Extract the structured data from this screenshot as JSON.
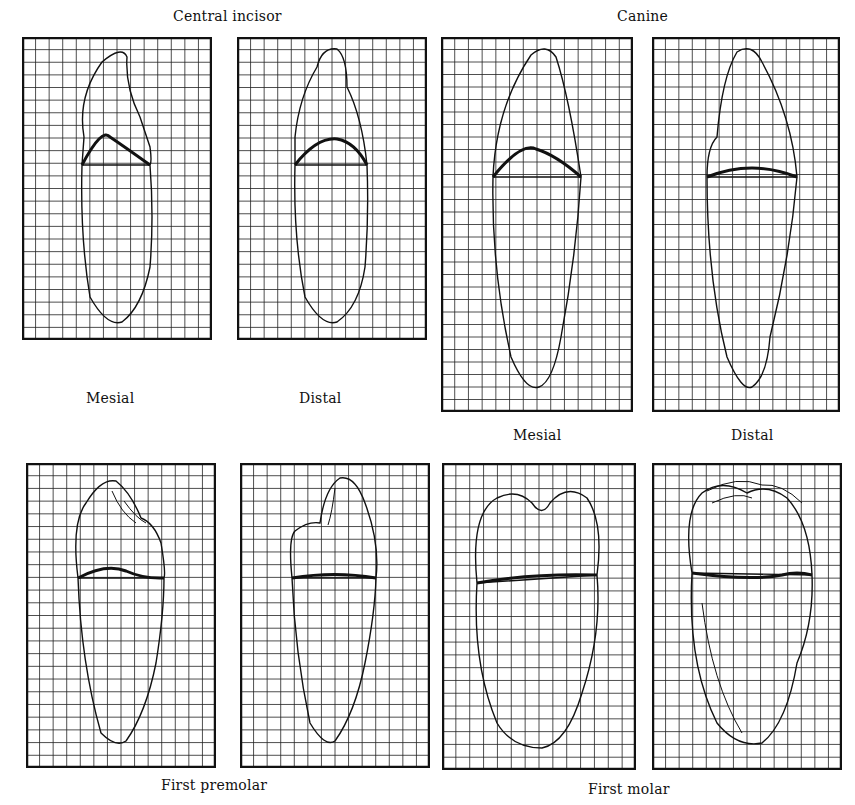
{
  "figure": {
    "groups": [
      {
        "title": "Central incisor",
        "views": [
          "Mesial",
          "Distal"
        ]
      },
      {
        "title": "Canine",
        "views": [
          "Mesial",
          "Distal"
        ]
      },
      {
        "title": "First premolar",
        "views": [],
        "position": "below"
      },
      {
        "title": "First molar",
        "views": [],
        "position": "below"
      }
    ],
    "labels": {
      "central_incisor": "Central incisor",
      "canine": "Canine",
      "first_premolar": "First premolar",
      "first_molar": "First molar",
      "incisor_mesial": "Mesial",
      "incisor_distal": "Distal",
      "canine_mesial": "Mesial",
      "canine_distal": "Distal"
    },
    "panels": [
      {
        "id": "incisor-mesial",
        "x": 22,
        "y": 37,
        "w": 190,
        "h": 303,
        "cols": 14,
        "rows": 24
      },
      {
        "id": "incisor-distal",
        "x": 237,
        "y": 37,
        "w": 190,
        "h": 303,
        "cols": 14,
        "rows": 24
      },
      {
        "id": "canine-mesial",
        "x": 441,
        "y": 37,
        "w": 192,
        "h": 375,
        "cols": 14,
        "rows": 30
      },
      {
        "id": "canine-distal",
        "x": 652,
        "y": 37,
        "w": 188,
        "h": 375,
        "cols": 14,
        "rows": 30
      },
      {
        "id": "premolar-mesial",
        "x": 26,
        "y": 463,
        "w": 190,
        "h": 305,
        "cols": 14,
        "rows": 24
      },
      {
        "id": "premolar-distal",
        "x": 240,
        "y": 463,
        "w": 190,
        "h": 305,
        "cols": 14,
        "rows": 24
      },
      {
        "id": "molar-mesial",
        "x": 442,
        "y": 463,
        "w": 194,
        "h": 307,
        "cols": 14,
        "rows": 24
      },
      {
        "id": "molar-distal",
        "x": 652,
        "y": 463,
        "w": 190,
        "h": 307,
        "cols": 14,
        "rows": 24
      }
    ],
    "colors": {
      "ink": "#111111",
      "grid": "#222222",
      "paper": "#ffffff"
    }
  }
}
